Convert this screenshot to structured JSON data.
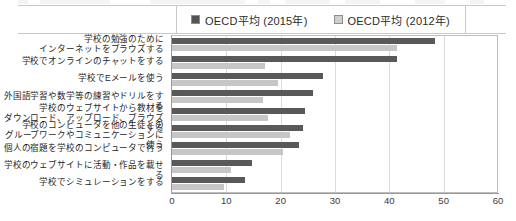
{
  "legend": {
    "items": [
      {
        "label": "OECD平均 (2015年)",
        "color": "#595959",
        "key": "v2015"
      },
      {
        "label": "OECD平均 (2012年)",
        "color": "#c6c6c6",
        "key": "v2012"
      }
    ]
  },
  "chart_data": {
    "type": "bar",
    "orientation": "horizontal",
    "title": "",
    "xlabel": "",
    "ylabel": "",
    "xlim": [
      0,
      60
    ],
    "xticks": [
      0,
      10,
      20,
      30,
      40,
      50,
      60
    ],
    "grid": true,
    "legend_position": "top",
    "categories": [
      "学校の勉強のために\nインターネットをブラウズする",
      "学校でオンラインのチャットをする",
      "学校でEメールを使う",
      "外国語学習や数学等の練習やドリルをする",
      "学校のウェブサイトから教材を\nダウンロード、アップロード、ブラウズする",
      "学校のコンピュータを他の生徒との\nグループワークやコミュニケーションに使う",
      "個人の宿題を学校のコンピュータで行う",
      "学校のウェブサイトに活動・作品を載せる",
      "学校でシミュレーションをする"
    ],
    "series": [
      {
        "name": "OECD平均 (2015年)",
        "color": "#595959",
        "values": [
          48.4,
          41.4,
          27.8,
          26.0,
          24.5,
          24.2,
          23.3,
          14.8,
          13.5
        ]
      },
      {
        "name": "OECD平均 (2012年)",
        "color": "#c6c6c6",
        "values": [
          41.4,
          17.2,
          19.6,
          16.8,
          17.6,
          21.8,
          20.5,
          10.8,
          9.5
        ]
      }
    ]
  }
}
